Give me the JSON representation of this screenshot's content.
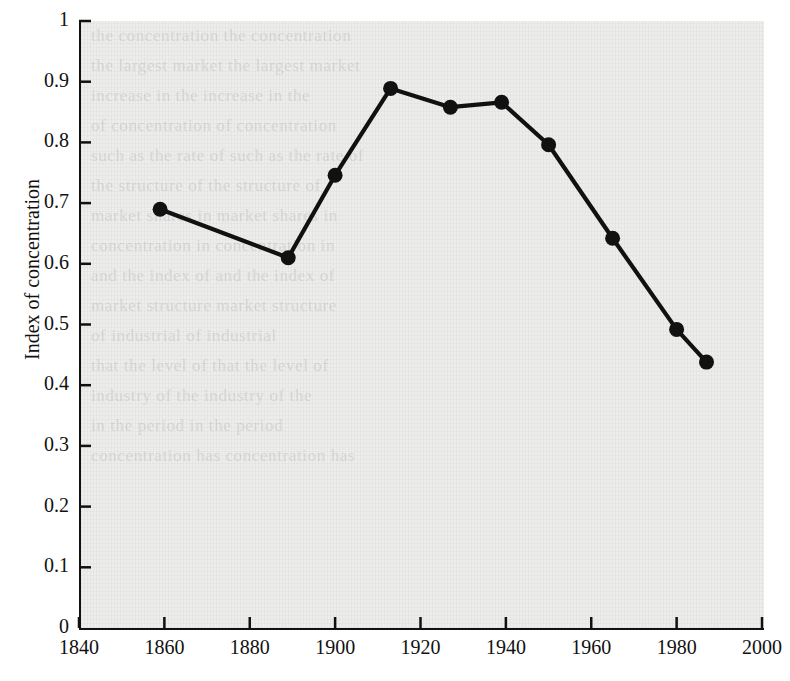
{
  "chart_data": {
    "type": "line",
    "title": "",
    "xlabel": "",
    "ylabel": "Index of concentration",
    "xlim": [
      1840,
      2000
    ],
    "ylim": [
      0,
      1
    ],
    "grid": false,
    "legend": null,
    "xticks": [
      "1840",
      "1860",
      "1880",
      "1900",
      "1920",
      "1940",
      "1960",
      "1980",
      "2000"
    ],
    "yticks": [
      "0",
      "0.1",
      "0.2",
      "0.3",
      "0.4",
      "0.5",
      "0.6",
      "0.7",
      "0.8",
      "0.9",
      "1"
    ],
    "series": [
      {
        "name": "Index of concentration",
        "marker": "filled-circle",
        "color": "#111111",
        "x": [
          1859,
          1889,
          1900,
          1913,
          1927,
          1939,
          1950,
          1965,
          1980,
          1987
        ],
        "values": [
          0.69,
          0.61,
          0.746,
          0.889,
          0.858,
          0.866,
          0.796,
          0.642,
          0.492,
          0.438
        ]
      }
    ]
  },
  "figure": {
    "background_color": "#ededec",
    "axis_color": "#111111",
    "line_color": "#111111"
  },
  "showthrough_text": [
    "the concentration",
    "the largest market",
    "increase in the",
    "of concentration",
    "such as the rate of",
    "the structure of",
    "market shares in",
    "concentration in",
    "and the index of",
    "market structure",
    "of industrial",
    "that the level of",
    "industry of the",
    "in the period",
    "concentration has"
  ]
}
